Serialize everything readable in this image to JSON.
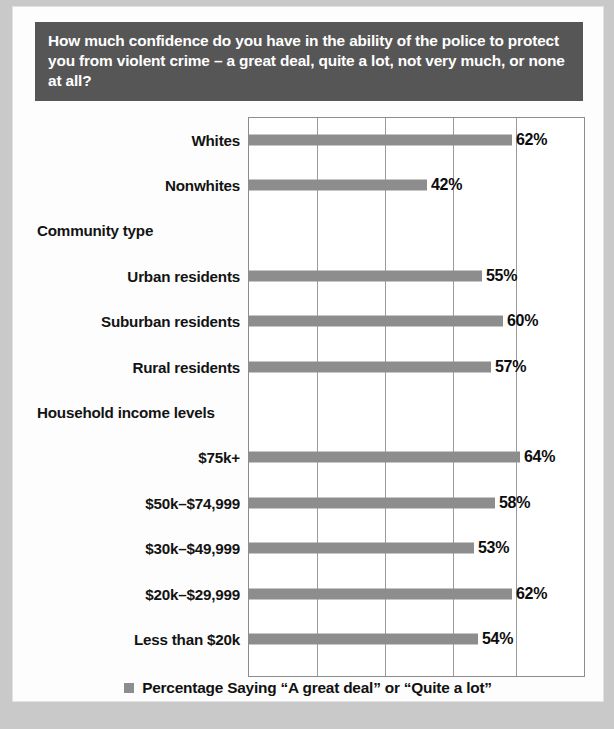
{
  "banner": {
    "question": "How much confidence do you have in the ability of the police to protect you from violent crime – a great deal, quite a lot, not very much, or none at all?"
  },
  "legend": {
    "label": "Percentage Saying “A great deal” or “Quite a lot”",
    "swatch_color": "#8d8d8d"
  },
  "colors": {
    "banner_background": "#565656",
    "banner_text": "#ffffff",
    "bar": "#8d8d8d",
    "plot_border": "#8c8c8c",
    "gridline": "#9a9a9a",
    "card_background": "#fdfdfd",
    "page_background": "#c9c9c9"
  },
  "chart_data": {
    "type": "bar",
    "orientation": "horizontal",
    "title": "How much confidence do you have in the ability of the police to protect you from violent crime – a great deal, quite a lot, not very much, or none at all?",
    "xlabel": "",
    "ylabel": "",
    "xlim": [
      0,
      79
    ],
    "grid": true,
    "gridline_values": [
      16,
      32,
      48,
      63,
      79
    ],
    "legend_position": "bottom",
    "series": [
      {
        "name": "Percentage Saying “A great deal” or “Quite a lot”",
        "values": [
          62,
          42,
          null,
          55,
          60,
          57,
          null,
          64,
          58,
          53,
          62,
          54
        ]
      }
    ],
    "rows": [
      {
        "label": "Whites",
        "value": 62,
        "display": "62%",
        "is_group_header": false
      },
      {
        "label": "Nonwhites",
        "value": 42,
        "display": "42%",
        "is_group_header": false
      },
      {
        "label": "Community type",
        "value": null,
        "display": "",
        "is_group_header": true
      },
      {
        "label": "Urban residents",
        "value": 55,
        "display": "55%",
        "is_group_header": false
      },
      {
        "label": "Suburban residents",
        "value": 60,
        "display": "60%",
        "is_group_header": false
      },
      {
        "label": "Rural residents",
        "value": 57,
        "display": "57%",
        "is_group_header": false
      },
      {
        "label": "Household income levels",
        "value": null,
        "display": "",
        "is_group_header": true
      },
      {
        "label": "$75k+",
        "value": 64,
        "display": "64%",
        "is_group_header": false
      },
      {
        "label": "$50k–$74,999",
        "value": 58,
        "display": "58%",
        "is_group_header": false
      },
      {
        "label": "$30k–$49,999",
        "value": 53,
        "display": "53%",
        "is_group_header": false
      },
      {
        "label": "$20k–$29,999",
        "value": 62,
        "display": "62%",
        "is_group_header": false
      },
      {
        "label": "Less than $20k",
        "value": 54,
        "display": "54%",
        "is_group_header": false
      }
    ]
  }
}
